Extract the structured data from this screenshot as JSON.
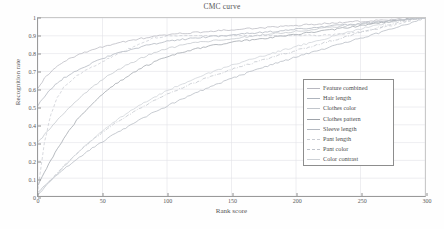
{
  "chart_data": {
    "type": "line",
    "title": "CMC curve",
    "xlabel": "Rank score",
    "ylabel": "Recognition rate",
    "xlim": [
      0,
      300
    ],
    "ylim": [
      0,
      1
    ],
    "xticks": [
      0,
      50,
      100,
      150,
      200,
      250,
      300
    ],
    "yticks": [
      0,
      0.1,
      0.2,
      0.3,
      0.4,
      0.5,
      0.6,
      0.7,
      0.8,
      0.9,
      1
    ],
    "xtick_labels": [
      "0",
      "50",
      "100",
      "150",
      "200",
      "250",
      "300"
    ],
    "ytick_labels": [
      "0",
      "0.1",
      "0.2",
      "0.3",
      "0.4",
      "0.5",
      "0.6",
      "0.7",
      "0.8",
      "0.9",
      "1"
    ],
    "grid": true,
    "legend_position": "right-middle",
    "x": [
      0,
      5,
      10,
      15,
      20,
      30,
      40,
      50,
      60,
      70,
      80,
      90,
      100,
      110,
      120,
      130,
      140,
      150,
      160,
      170,
      180,
      190,
      200,
      210,
      220,
      230,
      240,
      250,
      260,
      270,
      280,
      290,
      295,
      300
    ],
    "series": [
      {
        "name": "Feature combined",
        "color": "#b8b8c0",
        "dash": "solid",
        "values": [
          0.61,
          0.66,
          0.7,
          0.73,
          0.755,
          0.79,
          0.815,
          0.838,
          0.857,
          0.872,
          0.885,
          0.896,
          0.905,
          0.912,
          0.918,
          0.923,
          0.928,
          0.933,
          0.938,
          0.943,
          0.948,
          0.953,
          0.958,
          0.963,
          0.968,
          0.972,
          0.977,
          0.981,
          0.985,
          0.989,
          0.993,
          0.997,
          0.999,
          1.0
        ]
      },
      {
        "name": "Hair length",
        "color": "#aeb4bd",
        "dash": "solid",
        "values": [
          0.51,
          0.56,
          0.6,
          0.635,
          0.663,
          0.706,
          0.74,
          0.772,
          0.797,
          0.818,
          0.838,
          0.855,
          0.868,
          0.878,
          0.886,
          0.893,
          0.899,
          0.905,
          0.911,
          0.917,
          0.923,
          0.929,
          0.936,
          0.943,
          0.95,
          0.956,
          0.963,
          0.969,
          0.976,
          0.982,
          0.988,
          0.995,
          0.998,
          1.0
        ]
      },
      {
        "name": "Clothes color",
        "color": "#c2c6cc",
        "dash": "solid",
        "values": [
          0.3,
          0.345,
          0.385,
          0.425,
          0.465,
          0.535,
          0.6,
          0.655,
          0.7,
          0.74,
          0.775,
          0.805,
          0.828,
          0.845,
          0.858,
          0.868,
          0.877,
          0.885,
          0.893,
          0.901,
          0.909,
          0.917,
          0.925,
          0.933,
          0.941,
          0.949,
          0.957,
          0.965,
          0.973,
          0.981,
          0.988,
          0.995,
          0.998,
          1.0
        ]
      },
      {
        "name": "Clothes pattern",
        "color": "#9ea3aa",
        "dash": "solid",
        "values": [
          0.06,
          0.13,
          0.2,
          0.265,
          0.325,
          0.425,
          0.505,
          0.572,
          0.628,
          0.676,
          0.718,
          0.752,
          0.781,
          0.803,
          0.822,
          0.838,
          0.851,
          0.862,
          0.872,
          0.881,
          0.89,
          0.899,
          0.908,
          0.917,
          0.926,
          0.936,
          0.946,
          0.956,
          0.966,
          0.976,
          0.986,
          0.995,
          0.998,
          1.0
        ]
      },
      {
        "name": "Sleeve length",
        "color": "#b4b9c1",
        "dash": "solid",
        "values": [
          0.02,
          0.055,
          0.09,
          0.122,
          0.152,
          0.208,
          0.258,
          0.305,
          0.35,
          0.392,
          0.432,
          0.47,
          0.506,
          0.54,
          0.572,
          0.603,
          0.632,
          0.66,
          0.686,
          0.711,
          0.735,
          0.758,
          0.78,
          0.802,
          0.823,
          0.844,
          0.865,
          0.886,
          0.907,
          0.929,
          0.951,
          0.975,
          0.99,
          1.0
        ]
      },
      {
        "name": "Pant length",
        "color": "#c9ccd2",
        "dash": "dashed",
        "values": [
          0.035,
          0.3,
          0.46,
          0.555,
          0.61,
          0.675,
          0.72,
          0.755,
          0.79,
          0.825,
          0.858,
          0.888,
          0.9,
          0.901,
          0.901,
          0.901,
          0.901,
          0.901,
          0.901,
          0.901,
          0.901,
          0.901,
          0.901,
          0.902,
          0.903,
          0.906,
          0.912,
          0.921,
          0.934,
          0.95,
          0.968,
          0.988,
          0.996,
          1.0
        ]
      },
      {
        "name": "Pant color",
        "color": "#bfc3ca",
        "dash": "dashdot",
        "values": [
          0.01,
          0.05,
          0.09,
          0.13,
          0.168,
          0.238,
          0.3,
          0.358,
          0.41,
          0.455,
          0.497,
          0.535,
          0.57,
          0.602,
          0.632,
          0.66,
          0.686,
          0.71,
          0.733,
          0.755,
          0.776,
          0.797,
          0.817,
          0.837,
          0.857,
          0.877,
          0.898,
          0.918,
          0.938,
          0.958,
          0.975,
          0.992,
          0.997,
          1.0
        ]
      },
      {
        "name": "Color contrast",
        "color": "#cdd1d6",
        "dash": "solid",
        "values": [
          0.005,
          0.045,
          0.085,
          0.125,
          0.165,
          0.238,
          0.305,
          0.365,
          0.42,
          0.47,
          0.515,
          0.555,
          0.592,
          0.625,
          0.655,
          0.683,
          0.709,
          0.733,
          0.756,
          0.778,
          0.799,
          0.819,
          0.839,
          0.859,
          0.879,
          0.899,
          0.919,
          0.938,
          0.956,
          0.972,
          0.986,
          0.996,
          0.999,
          1.0
        ]
      }
    ]
  }
}
